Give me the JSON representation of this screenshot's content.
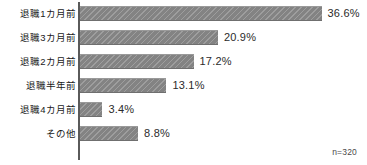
{
  "chart_data": {
    "type": "bar",
    "orientation": "horizontal",
    "title": "",
    "xlabel": "",
    "ylabel": "",
    "categories": [
      "退職1カ月前",
      "退職3カ月前",
      "退職2カ月前",
      "退職半年前",
      "退職4カ月前",
      "その他"
    ],
    "values": [
      36.6,
      20.9,
      17.2,
      13.1,
      3.4,
      8.8
    ],
    "value_labels": [
      "36.6%",
      "20.9%",
      "17.2%",
      "13.1%",
      "3.4%",
      "8.8%"
    ],
    "xlim": [
      0,
      36.6
    ],
    "grid": false,
    "legend": null,
    "annotations": [
      "n=320"
    ],
    "bar_color": "#8a8a8a",
    "axis_color": "#5a5a5a"
  },
  "chart": {
    "sample_note": "n=320",
    "px_per_percent": 6.6
  }
}
